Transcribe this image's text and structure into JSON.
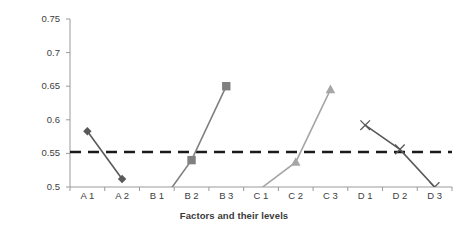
{
  "chart_data": {
    "type": "line",
    "title": "",
    "xlabel": "Factors and their levels",
    "ylabel": "Grey Relational Grade",
    "categories": [
      "A 1",
      "A 2",
      "B 1",
      "B 2",
      "B 3",
      "C 1",
      "C 2",
      "C 3",
      "D 1",
      "D 2",
      "D 3"
    ],
    "ylim": [
      0.5,
      0.75
    ],
    "yticks": [
      "0.5",
      "0.55",
      "0.6",
      "0.65",
      "0.7",
      "0.75"
    ],
    "ytick_values": [
      0.5,
      0.55,
      0.6,
      0.65,
      0.7,
      0.75
    ],
    "grid": false,
    "legend": "none",
    "reference_line": {
      "label": "mean grey relational grade",
      "value": 0.552,
      "style": "dashed",
      "color": "#1a1a1a"
    },
    "series": [
      {
        "name": "Factor A",
        "marker": "diamond",
        "color": "#595959",
        "points": [
          {
            "x": "A 1",
            "y": 0.583
          },
          {
            "x": "A 2",
            "y": 0.512
          }
        ]
      },
      {
        "name": "Factor B",
        "marker": "square",
        "color": "#808080",
        "points": [
          {
            "x": "B 1",
            "y": 0.468
          },
          {
            "x": "B 2",
            "y": 0.54
          },
          {
            "x": "B 3",
            "y": 0.65
          }
        ],
        "note": "B 1 value falls below the plotted axis minimum of 0.5 and is clipped"
      },
      {
        "name": "Factor C",
        "marker": "triangle",
        "color": "#a6a6a6",
        "points": [
          {
            "x": "C 1",
            "y": 0.498
          },
          {
            "x": "C 2",
            "y": 0.537
          },
          {
            "x": "C 3",
            "y": 0.645
          }
        ]
      },
      {
        "name": "Factor D",
        "marker": "cross",
        "color": "#595959",
        "points": [
          {
            "x": "D 1",
            "y": 0.592
          },
          {
            "x": "D 2",
            "y": 0.556
          },
          {
            "x": "D 3",
            "y": 0.5
          }
        ]
      }
    ]
  }
}
